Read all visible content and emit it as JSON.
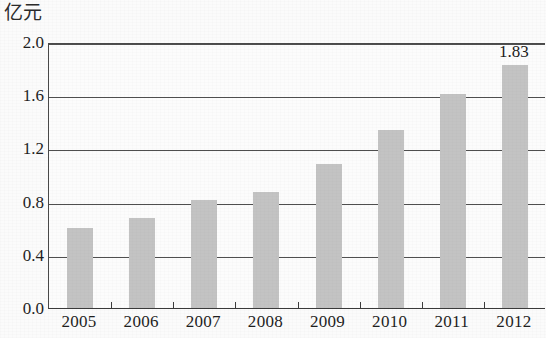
{
  "chart_data": {
    "type": "bar",
    "title": "",
    "subtitle": "",
    "unit_label": "亿元",
    "xlabel": "",
    "ylabel": "",
    "categories": [
      "2005",
      "2006",
      "2007",
      "2008",
      "2009",
      "2010",
      "2011",
      "2012"
    ],
    "values": [
      0.6,
      0.68,
      0.81,
      0.87,
      1.08,
      1.34,
      1.61,
      1.83
    ],
    "data_labels": [
      "",
      "",
      "",
      "",
      "",
      "",
      "",
      "1.83"
    ],
    "ylim": [
      0.0,
      2.0
    ],
    "ytick_labels": [
      "0.0",
      "0.4",
      "0.8",
      "1.2",
      "1.6",
      "2.0"
    ],
    "ytick_values": [
      0.0,
      0.4,
      0.8,
      1.2,
      1.6,
      2.0
    ],
    "grid": true,
    "grid_axis": "y",
    "legend": false,
    "legend_position": "none",
    "bar_color": "#c3c3c3",
    "axis_color": "#4a4a4a",
    "text_color": "#1f1f1f",
    "background_color": "#fbfbfb"
  }
}
